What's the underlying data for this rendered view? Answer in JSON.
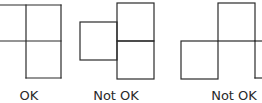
{
  "figures": [
    {
      "id": "figure-1",
      "label": "OK",
      "arrangement": "two-by-two grid missing bottom-left cell (L-shaped triomino of squares)"
    },
    {
      "id": "figure-2",
      "label": "Not OK",
      "arrangement": "vertical pair of squares with a third square attached to left side, offset vertically"
    },
    {
      "id": "figure-3",
      "label": "Not OK",
      "arrangement": "squares joined corner-to-edge in a staircase pattern"
    }
  ],
  "colors": {
    "line": "#2a2a2a",
    "background": "#ffffff"
  }
}
